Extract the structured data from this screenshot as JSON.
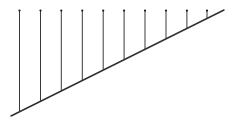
{
  "figure": {
    "type": "line-diagram",
    "canvas": {
      "width": 239,
      "height": 121,
      "background": "#ffffff"
    },
    "colors": {
      "stroke": "#3a3a3a",
      "baseline_stroke": "#2e2e2e",
      "cap_dot": "#1c1c1c",
      "background": "#ffffff"
    },
    "baseline": {
      "label": "diagonal-baseline",
      "x1": 11,
      "y1": 116,
      "x2": 224,
      "y2": 10,
      "stroke_width": 1.4,
      "slope": -0.5
    },
    "verticals": {
      "count": 10,
      "top_y": 10,
      "stroke_width": 1.0,
      "cap_radius": 1.1,
      "items": [
        {
          "label": "vertical-1",
          "x": 19.5,
          "y_top": 10,
          "y_bottom": 111.8,
          "length": 101.8
        },
        {
          "label": "vertical-2",
          "x": 40.5,
          "y_top": 10,
          "y_bottom": 101.3,
          "length": 91.3
        },
        {
          "label": "vertical-3",
          "x": 61.3,
          "y_top": 10,
          "y_bottom": 90.9,
          "length": 80.9
        },
        {
          "label": "vertical-4",
          "x": 82.3,
          "y_top": 10,
          "y_bottom": 80.4,
          "length": 70.4
        },
        {
          "label": "vertical-5",
          "x": 103.2,
          "y_top": 10,
          "y_bottom": 69.9,
          "length": 59.9
        },
        {
          "label": "vertical-6",
          "x": 124.1,
          "y_top": 10,
          "y_bottom": 59.5,
          "length": 49.5
        },
        {
          "label": "vertical-7",
          "x": 145.0,
          "y_top": 10,
          "y_bottom": 49.0,
          "length": 39.0
        },
        {
          "label": "vertical-8",
          "x": 166.0,
          "y_top": 10,
          "y_bottom": 38.5,
          "length": 28.5
        },
        {
          "label": "vertical-9",
          "x": 186.9,
          "y_top": 10,
          "y_bottom": 28.1,
          "length": 18.1
        },
        {
          "label": "vertical-10",
          "x": 207.0,
          "y_top": 10,
          "y_bottom": 18.0,
          "length": 8.0
        }
      ]
    }
  },
  "chart_data": {
    "type": "bar",
    "title": "",
    "xlabel": "",
    "ylabel": "",
    "categories": [
      "1",
      "2",
      "3",
      "4",
      "5",
      "6",
      "7",
      "8",
      "9",
      "10"
    ],
    "values": [
      101.8,
      91.3,
      80.9,
      70.4,
      59.9,
      49.5,
      39.0,
      28.5,
      18.1,
      8.0
    ],
    "note": "Vertical segment lengths in pixels, measured from a common top edge down to a diagonal baseline.",
    "grid": false,
    "legend": "none"
  }
}
